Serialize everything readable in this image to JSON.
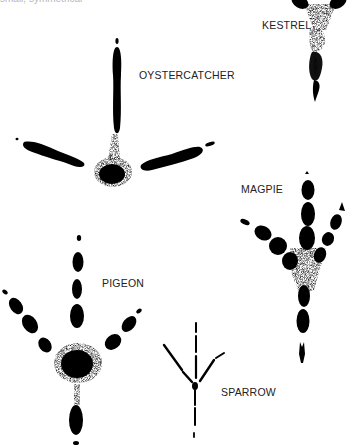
{
  "caption_partial": "small, symmetrical",
  "labels": {
    "kestrel": "KESTREL",
    "oystercatcher": "OYSTERCATCHER",
    "magpie": "MAGPIE",
    "pigeon": "PIGEON",
    "sparrow": "SPARROW"
  },
  "colors": {
    "ink": "#000000",
    "background": "#ffffff",
    "label": "#222222"
  }
}
